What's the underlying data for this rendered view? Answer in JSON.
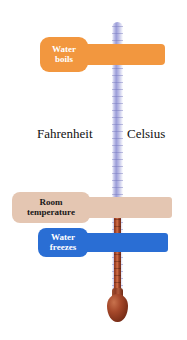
{
  "diagram": {
    "scales": {
      "fahrenheit_label": "Fahrenheit",
      "celsius_label": "Celsius"
    },
    "reference_points": [
      {
        "id": "water-boils",
        "label_line1": "Water",
        "label_line2": "boils",
        "fahrenheit": "212°",
        "celsius": "100°",
        "color": "#f2973f",
        "text_color": "#ffffff"
      },
      {
        "id": "room-temperature",
        "label_line1": "Room",
        "label_line2": "temperature",
        "fahrenheit": "68°",
        "celsius": "20°",
        "color": "#e4c6b2",
        "text_color": "#171717"
      },
      {
        "id": "water-freezes",
        "label_line1": "Water",
        "label_line2": "freezes",
        "fahrenheit": "32°",
        "celsius": "0°",
        "color": "#2a6ed4",
        "text_color": "#ffffff"
      }
    ],
    "thermometer": {
      "tube_color": "#9a9cd8",
      "mercury_color": "#a5482a",
      "bulb_color": "#7d3019",
      "background_color": "#ffffff"
    }
  },
  "chart_data": {
    "type": "table",
    "categories": [
      "Water boils",
      "Room temperature",
      "Water freezes"
    ],
    "series": [
      {
        "name": "Fahrenheit",
        "values": [
          212,
          68,
          32
        ]
      },
      {
        "name": "Celsius",
        "values": [
          100,
          20,
          0
        ]
      }
    ],
    "units": "degrees",
    "xlabel": "",
    "ylabel": "Temperature",
    "legend": [
      "Fahrenheit",
      "Celsius"
    ],
    "grid": false
  }
}
